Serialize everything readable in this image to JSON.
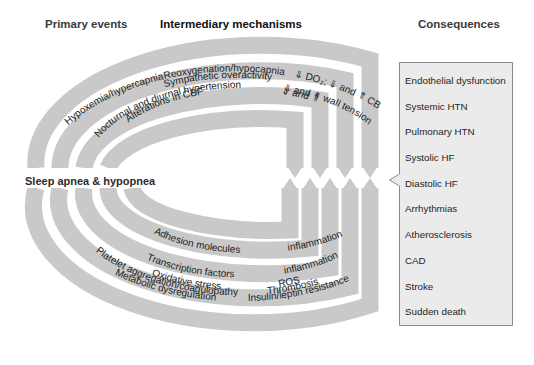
{
  "headings": {
    "primary": "Primary events",
    "intermediary": "Intermediary mechanisms",
    "consequences": "Consequences"
  },
  "center_label": "Sleep apnea & hypopnea",
  "colors": {
    "band": "#c9c9c9",
    "box_fill": "#ebebeb",
    "box_border": "#8a8a8a",
    "background": "#ffffff"
  },
  "top_bands": [
    {
      "primary": "Hypoxemia/hypercapnia",
      "mechanism": "Reoxygenation/hypocapnia",
      "effect": "⇓ DO₂; ⇓ and ⇑ CBF"
    },
    {
      "primary": "",
      "mechanism": "Sympathetic overactivity",
      "effect": ""
    },
    {
      "primary": "",
      "mechanism": "Nocturnal and diurnal hypertension",
      "effect": "⇓ and ⇑ wall tension"
    },
    {
      "primary": "",
      "mechanism": "Alterations in CBF",
      "effect": "⇓ and ⇑"
    }
  ],
  "bottom_bands": [
    {
      "mechanism": "Adhesion molecules",
      "effect": "inflammation"
    },
    {
      "mechanism": "Transcription factors",
      "effect": "inflammation"
    },
    {
      "mechanism": "Oxidative stress",
      "effect": "ROS"
    },
    {
      "mechanism": "Platelet aggregation/coagulopathy",
      "effect": "Thrombosis"
    },
    {
      "mechanism": "Metabolic dysregulation",
      "effect": "Insulin/leptin resistance"
    }
  ],
  "consequences": [
    "Endothelial dysfunction",
    "Systemic HTN",
    "Pulmonary HTN",
    "Systolic HF",
    "Diastolic HF",
    "Arrhythmias",
    "Atherosclerosis",
    "CAD",
    "Stroke",
    "Sudden death"
  ]
}
